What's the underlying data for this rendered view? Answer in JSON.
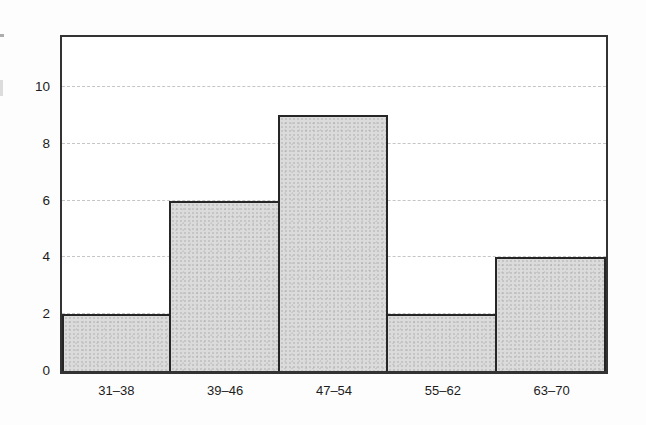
{
  "chart_data": {
    "type": "bar",
    "subtype": "histogram",
    "categories": [
      "31–38",
      "39–46",
      "47–54",
      "55–62",
      "63–70"
    ],
    "values": [
      2,
      6,
      9,
      2,
      4
    ],
    "title": "",
    "xlabel": "",
    "ylabel": "",
    "ylim": [
      0,
      12
    ],
    "yticks": [
      0,
      2,
      4,
      6,
      8,
      10
    ],
    "grid": "horizontal-dashed",
    "legend": "none",
    "bar_gap": 0,
    "bar_fill": "#dbdbdb",
    "bar_border": "#262626",
    "axis_color": "#333333",
    "grid_color": "#969696",
    "tick_label_color": "#1c1c1c",
    "background": "#ffffff"
  }
}
